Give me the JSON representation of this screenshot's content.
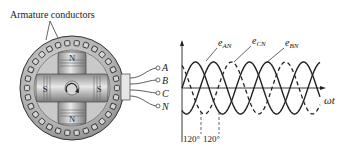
{
  "generator": {
    "callout_label": "Armature conductors",
    "rotor_poles": {
      "top": "N",
      "bottom": "N",
      "left": "S",
      "right": "S"
    },
    "terminals": [
      {
        "label": "A"
      },
      {
        "label": "B"
      },
      {
        "label": "C"
      },
      {
        "label": "N"
      }
    ],
    "rotation_icon": "clockwise-arrow-icon"
  },
  "waveform": {
    "curves": [
      {
        "label": "e",
        "subscript": "AN",
        "style": "solid"
      },
      {
        "label": "e",
        "subscript": "CN",
        "style": "dashed"
      },
      {
        "label": "e",
        "subscript": "BN",
        "style": "solid"
      }
    ],
    "x_axis_label": "ωt",
    "phase_labels": [
      "120°",
      "120°"
    ],
    "colors": {
      "stroke": "#222222",
      "motor_fill": "#b8b8b8",
      "motor_dark": "#7a7a7a"
    }
  }
}
